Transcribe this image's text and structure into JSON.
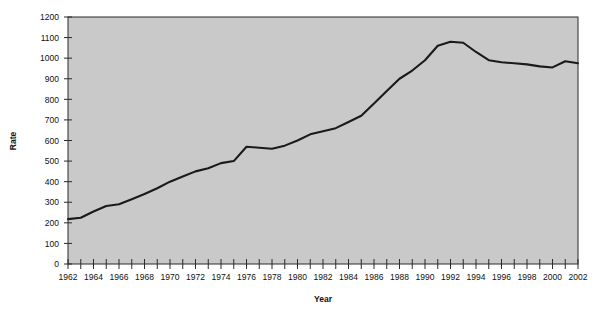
{
  "chart_data": {
    "type": "line",
    "title": "",
    "xlabel": "Year",
    "ylabel": "Rate",
    "xlim": [
      1962,
      2002
    ],
    "ylim": [
      0,
      1200
    ],
    "grid": false,
    "legend": null,
    "y_ticks": [
      0,
      100,
      200,
      300,
      400,
      500,
      600,
      700,
      800,
      900,
      1000,
      1100,
      1200
    ],
    "y_tick_labels": [
      "0",
      "100",
      "200",
      "300",
      "400",
      "500",
      "600",
      "700",
      "800",
      "900",
      "1000",
      "1100",
      "1200"
    ],
    "x_ticks": [
      1962,
      1963,
      1964,
      1965,
      1966,
      1967,
      1968,
      1969,
      1970,
      1971,
      1972,
      1973,
      1974,
      1975,
      1976,
      1977,
      1978,
      1979,
      1980,
      1981,
      1982,
      1983,
      1984,
      1985,
      1986,
      1987,
      1988,
      1989,
      1990,
      1991,
      1992,
      1993,
      1994,
      1995,
      1996,
      1997,
      1998,
      1999,
      2000,
      2001,
      2002
    ],
    "x_tick_labels": [
      "1962",
      "",
      "1964",
      "",
      "1966",
      "",
      "1968",
      "",
      "1970",
      "",
      "1972",
      "",
      "1974",
      "",
      "1976",
      "",
      "1978",
      "",
      "1980",
      "",
      "1982",
      "",
      "1984",
      "",
      "1986",
      "",
      "1988",
      "",
      "1990",
      "",
      "1992",
      "",
      "1994",
      "",
      "1996",
      "",
      "1998",
      "",
      "2000",
      "",
      "2002"
    ],
    "x": [
      1962,
      1963,
      1964,
      1965,
      1966,
      1967,
      1968,
      1969,
      1970,
      1971,
      1972,
      1973,
      1974,
      1975,
      1976,
      1977,
      1978,
      1979,
      1980,
      1981,
      1982,
      1983,
      1984,
      1985,
      1986,
      1987,
      1988,
      1989,
      1990,
      1991,
      1992,
      1993,
      1994,
      1995,
      1996,
      1997,
      1998,
      1999,
      2000,
      2001,
      2002
    ],
    "values": [
      218,
      225,
      255,
      282,
      290,
      315,
      340,
      368,
      400,
      425,
      450,
      465,
      490,
      500,
      570,
      565,
      560,
      575,
      600,
      630,
      645,
      660,
      690,
      720,
      780,
      840,
      900,
      940,
      990,
      1060,
      1080,
      1075,
      1030,
      990,
      980,
      975,
      970,
      960,
      955,
      985,
      975
    ],
    "series_name": "Rate",
    "line_color": "#1a1a1a",
    "plot_background_color": "#c9c9c9",
    "page_background_color": "#ffffff"
  }
}
